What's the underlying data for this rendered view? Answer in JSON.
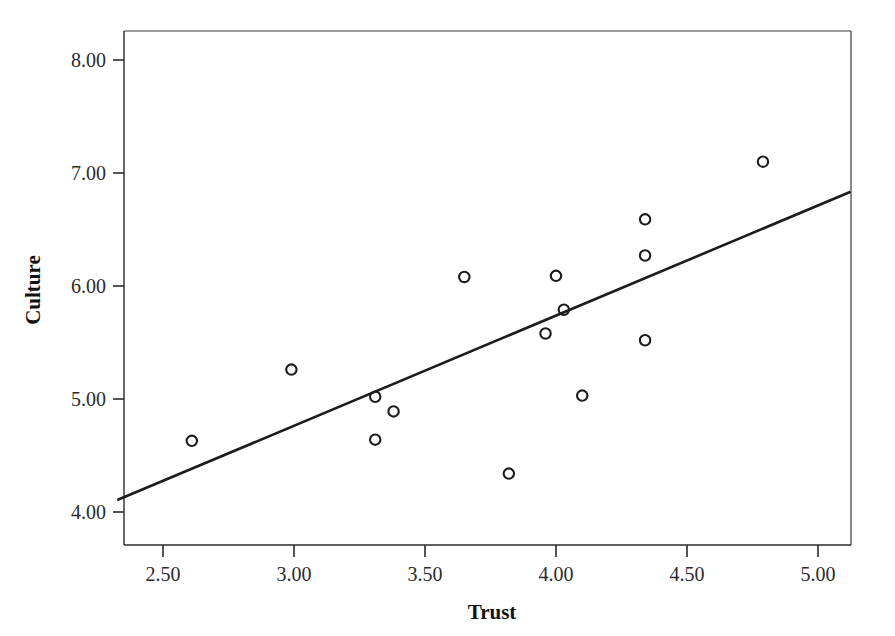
{
  "chart_data": {
    "type": "scatter",
    "title": "",
    "subtitle": "",
    "xlabel": "Trust",
    "ylabel": "Culture",
    "xlim": [
      2.33,
      5.12
    ],
    "ylim": [
      3.7,
      8.26
    ],
    "grid": false,
    "legend": "none",
    "x_ticks": [
      "2.50",
      "3.00",
      "3.50",
      "4.00",
      "4.50",
      "5.00"
    ],
    "x_tick_values": [
      2.5,
      3.0,
      3.5,
      4.0,
      4.5,
      5.0
    ],
    "y_ticks": [
      "4.00",
      "5.00",
      "6.00",
      "7.00",
      "8.00"
    ],
    "y_tick_values": [
      4.0,
      5.0,
      6.0,
      7.0,
      8.0
    ],
    "marker": "open-circle",
    "x": [
      2.61,
      2.99,
      3.31,
      3.31,
      3.38,
      3.65,
      3.82,
      3.96,
      4.0,
      4.03,
      4.1,
      4.34,
      4.34,
      4.34,
      4.79
    ],
    "y": [
      4.63,
      5.26,
      5.02,
      4.64,
      4.89,
      6.08,
      4.34,
      5.58,
      6.09,
      5.79,
      5.03,
      6.59,
      6.27,
      5.52,
      7.1
    ],
    "points": [
      {
        "x": 2.61,
        "y": 4.63
      },
      {
        "x": 2.99,
        "y": 5.26
      },
      {
        "x": 3.31,
        "y": 5.02
      },
      {
        "x": 3.31,
        "y": 4.64
      },
      {
        "x": 3.38,
        "y": 4.89
      },
      {
        "x": 3.65,
        "y": 6.08
      },
      {
        "x": 3.82,
        "y": 4.34
      },
      {
        "x": 3.96,
        "y": 5.58
      },
      {
        "x": 4.0,
        "y": 6.09
      },
      {
        "x": 4.03,
        "y": 5.79
      },
      {
        "x": 4.1,
        "y": 5.03
      },
      {
        "x": 4.34,
        "y": 6.59
      },
      {
        "x": 4.34,
        "y": 6.27
      },
      {
        "x": 4.34,
        "y": 5.52
      },
      {
        "x": 4.79,
        "y": 7.1
      }
    ],
    "fit_line": {
      "type": "linear",
      "x_start": 2.33,
      "y_start": 4.11,
      "x_end": 5.12,
      "y_end": 6.83
    },
    "series": [
      {
        "name": "Culture vs Trust",
        "marker_color": "#1c1c1c",
        "line_color": "#1c1c1c"
      }
    ]
  },
  "colors": {
    "background": "#ffffff",
    "axis": "#2a2a2a",
    "frame": "#3d3d3d",
    "marker": "#1c1c1c",
    "fit_line": "#1c1c1c",
    "text": "#1a1a1a"
  }
}
